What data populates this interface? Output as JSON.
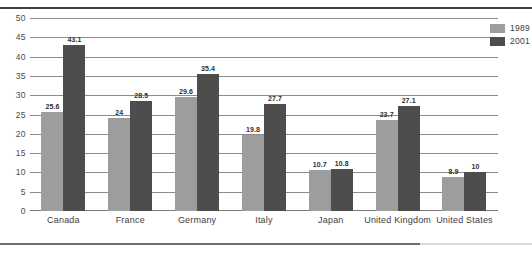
{
  "figure": {
    "title_sliver": "",
    "background_color": "#ffffff",
    "rule_color": "#404040"
  },
  "legend": {
    "position": "top-right",
    "entries": [
      {
        "label": "1989",
        "color": "#9d9d9d"
      },
      {
        "label": "2001",
        "color": "#4d4d4d"
      }
    ]
  },
  "axis": {
    "yticks": [
      "50",
      "45",
      "40",
      "35",
      "30",
      "25",
      "20",
      "15",
      "10",
      "5",
      "0"
    ]
  },
  "chart_data": {
    "type": "bar",
    "title": "",
    "xlabel": "",
    "ylabel": "",
    "ylim": [
      0,
      50
    ],
    "ytick_step": 5,
    "grid": true,
    "legend_position": "top-right",
    "categories": [
      "Canada",
      "France",
      "Germany",
      "Italy",
      "Japan",
      "United Kingdom",
      "United States"
    ],
    "series": [
      {
        "name": "1989",
        "color": "#9d9d9d",
        "values": [
          25.6,
          24,
          29.6,
          19.8,
          10.7,
          23.7,
          8.9
        ],
        "labels": [
          "25.6",
          "24",
          "29.6",
          "19.8",
          "10.7",
          "23.7",
          "8.9"
        ]
      },
      {
        "name": "2001",
        "color": "#4d4d4d",
        "values": [
          43.1,
          28.5,
          35.4,
          27.7,
          10.8,
          27.1,
          10
        ],
        "labels": [
          "43.1",
          "28.5",
          "35.4",
          "27.7",
          "10.8",
          "27.1",
          "10"
        ]
      }
    ]
  }
}
